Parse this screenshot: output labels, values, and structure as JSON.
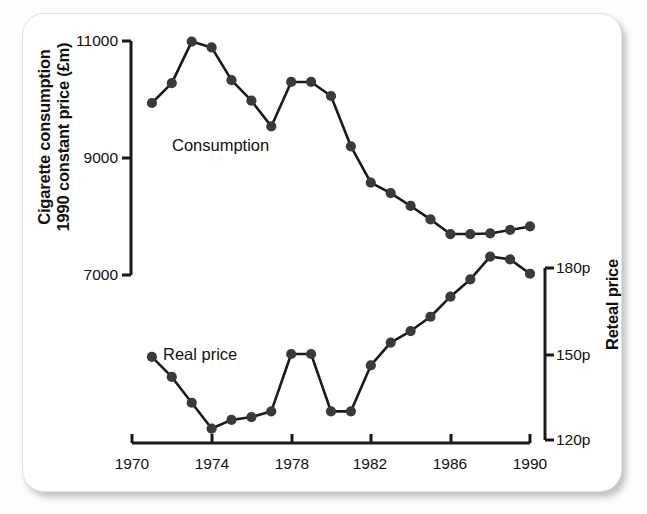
{
  "figure": {
    "background_color": "#ffffff",
    "ink_color": "#1a1a1a",
    "marker_color": "#3a3a3a"
  },
  "axes": {
    "left": {
      "title_line1": "Cigarette consumption",
      "title_line2": "1990 constant price (£m)",
      "ticks": [
        "11000",
        "9000",
        "7000"
      ],
      "tick_values": [
        11000,
        9000,
        7000
      ],
      "range": [
        7000,
        11000
      ]
    },
    "right": {
      "title": "Reteal price",
      "ticks": [
        "180p",
        "150p",
        "120p"
      ],
      "tick_values": [
        180,
        150,
        120
      ],
      "range": [
        120,
        180
      ]
    },
    "bottom": {
      "ticks": [
        "1970",
        "1974",
        "1978",
        "1982",
        "1986",
        "1990"
      ],
      "tick_values": [
        1970,
        1974,
        1978,
        1982,
        1986,
        1990
      ],
      "range": [
        1970,
        1990
      ]
    }
  },
  "series_labels": {
    "consumption": "Consumption",
    "real_price": "Real price"
  },
  "chart_data": {
    "type": "line",
    "title": "",
    "subtitle": "",
    "xlabel": "",
    "ylabel": "Cigarette consumption 1990 constant price (£m)",
    "y2label": "Reteal price",
    "xlim": [
      1970,
      1990
    ],
    "ylim": [
      7000,
      11000
    ],
    "y2lim": [
      120,
      180
    ],
    "grid": false,
    "legend": "inline-labels",
    "x": [
      1971,
      1972,
      1973,
      1974,
      1975,
      1976,
      1977,
      1978,
      1979,
      1980,
      1981,
      1982,
      1983,
      1984,
      1985,
      1986,
      1987,
      1988,
      1989,
      1990
    ],
    "series": [
      {
        "name": "Consumption",
        "axis": "left",
        "unit": "£m (1990 constant price)",
        "values": [
          9940,
          10280,
          10990,
          10890,
          10330,
          9980,
          9540,
          10300,
          10300,
          10060,
          9200,
          8580,
          8400,
          8180,
          7950,
          7700,
          7700,
          7710,
          7770,
          7830
        ]
      },
      {
        "name": "Real price",
        "axis": "right",
        "unit": "pence",
        "values": [
          149,
          142,
          133,
          124,
          127,
          128,
          130,
          150,
          150,
          130,
          130,
          146,
          154,
          158,
          163,
          170,
          176,
          184,
          183,
          178
        ],
        "note": "Real price series plotted against the right-hand axis; last plotted points decline to about 166p in 1990."
      }
    ],
    "annotations": [
      {
        "text": "Consumption",
        "x": 1972.8,
        "y_axis": "left",
        "y": 9400
      },
      {
        "text": "Real price",
        "x": 1972.4,
        "y_axis": "right",
        "y": 152
      }
    ]
  },
  "plot_geometry": {
    "x_pixel_1970": 132,
    "x_pixel_per_year": 19.9,
    "left_axis_y_11000": 41,
    "left_axis_y_7000": 275,
    "right_axis_y_180": 268,
    "right_axis_y_120": 440,
    "baseline_y": 443
  }
}
